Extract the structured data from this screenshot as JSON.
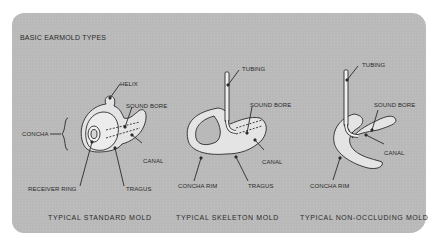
{
  "diagram": {
    "title": "BASIC EARMOLD TYPES",
    "panels": [
      {
        "caption": "TYPICAL STANDARD MOLD",
        "labels": {
          "helix": "HELIX",
          "sound_bore": "SOUND BORE",
          "concha": "CONCHA",
          "canal": "CANAL",
          "receiver_ring": "RECEIVER RING",
          "tragus": "TRAGUS"
        }
      },
      {
        "caption": "TYPICAL SKELETON MOLD",
        "labels": {
          "tubing": "TUBING",
          "sound_bore": "SOUND BORE",
          "canal": "CANAL",
          "concha_rim": "CONCHA RIM",
          "tragus": "TRAGUS"
        }
      },
      {
        "caption": "TYPICAL NON-OCCLUDING MOLD",
        "labels": {
          "tubing": "TUBING",
          "sound_bore": "SOUND BORE",
          "canal": "CANAL",
          "concha_rim": "CONCHA RIM"
        }
      }
    ],
    "colors": {
      "panel_bg": "#b9b9b9",
      "mold_fill": "#e4e4e4",
      "line": "#2a2a2a"
    }
  }
}
